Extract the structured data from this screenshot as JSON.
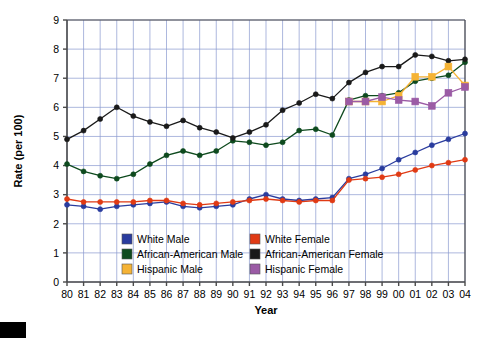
{
  "chart_data": {
    "type": "line",
    "title": "",
    "xlabel": "Year",
    "ylabel": "Rate (per 100)",
    "xlim": [
      80,
      104
    ],
    "ylim": [
      0,
      9
    ],
    "ytick_step": 1,
    "grid": true,
    "legend_position": "inside-bottom",
    "categories": [
      "80",
      "81",
      "82",
      "83",
      "84",
      "85",
      "86",
      "87",
      "88",
      "89",
      "90",
      "91",
      "92",
      "93",
      "94",
      "95",
      "96",
      "97",
      "98",
      "99",
      "00",
      "01",
      "02",
      "03",
      "04"
    ],
    "x": [
      1980,
      1981,
      1982,
      1983,
      1984,
      1985,
      1986,
      1987,
      1988,
      1989,
      1990,
      1991,
      1992,
      1993,
      1994,
      1995,
      1996,
      1997,
      1998,
      1999,
      2000,
      2001,
      2002,
      2003,
      2004
    ],
    "yticks": [
      "0",
      "1",
      "2",
      "3",
      "4",
      "5",
      "6",
      "7",
      "8",
      "9"
    ],
    "series": [
      {
        "name": "White Male",
        "color": "#2A3C9E",
        "marker": "circle",
        "values": [
          2.65,
          2.6,
          2.5,
          2.6,
          2.65,
          2.7,
          2.75,
          2.6,
          2.55,
          2.6,
          2.65,
          2.85,
          3.0,
          2.85,
          2.8,
          2.85,
          2.9,
          3.55,
          3.7,
          3.9,
          4.2,
          4.45,
          4.7,
          4.9,
          5.1
        ]
      },
      {
        "name": "White Female",
        "color": "#E03A14",
        "marker": "circle",
        "values": [
          2.85,
          2.75,
          2.75,
          2.75,
          2.75,
          2.8,
          2.8,
          2.7,
          2.65,
          2.7,
          2.75,
          2.8,
          2.85,
          2.8,
          2.75,
          2.8,
          2.8,
          3.5,
          3.55,
          3.6,
          3.7,
          3.85,
          4.0,
          4.1,
          4.2
        ]
      },
      {
        "name": "African-American Male",
        "color": "#0E4A1E",
        "marker": "circle",
        "values": [
          4.05,
          3.8,
          3.65,
          3.55,
          3.7,
          4.05,
          4.35,
          4.5,
          4.35,
          4.5,
          4.85,
          4.8,
          4.7,
          4.8,
          5.2,
          5.25,
          5.05,
          6.25,
          6.4,
          6.4,
          6.5,
          6.9,
          7.0,
          7.1,
          7.55
        ]
      },
      {
        "name": "African-American Female",
        "color": "#1A1A1A",
        "marker": "circle",
        "values": [
          4.9,
          5.2,
          5.6,
          6.0,
          5.7,
          5.5,
          5.35,
          5.55,
          5.3,
          5.15,
          4.95,
          5.15,
          5.4,
          5.9,
          6.15,
          6.45,
          6.3,
          6.85,
          7.2,
          7.4,
          7.4,
          7.8,
          7.75,
          7.6,
          7.65
        ]
      },
      {
        "name": "Hispanic Male",
        "color": "#F5B335",
        "marker": "square",
        "values": [
          null,
          null,
          null,
          null,
          null,
          null,
          null,
          null,
          null,
          null,
          null,
          null,
          null,
          null,
          null,
          null,
          null,
          6.2,
          6.2,
          6.2,
          6.4,
          7.05,
          7.05,
          7.4,
          6.75
        ]
      },
      {
        "name": "Hispanic Female",
        "color": "#9B5BA5",
        "marker": "square",
        "values": [
          null,
          null,
          null,
          null,
          null,
          null,
          null,
          null,
          null,
          null,
          null,
          null,
          null,
          null,
          null,
          null,
          null,
          6.2,
          6.2,
          6.35,
          6.25,
          6.2,
          6.05,
          6.5,
          6.7
        ]
      }
    ],
    "legend": [
      {
        "label": "White Male",
        "color": "#2A3C9E"
      },
      {
        "label": "White Female",
        "color": "#E03A14"
      },
      {
        "label": "African-American Male",
        "color": "#0E4A1E"
      },
      {
        "label": "African-American Female",
        "color": "#1A1A1A"
      },
      {
        "label": "Hispanic Male",
        "color": "#F5B335"
      },
      {
        "label": "Hispanic Female",
        "color": "#9B5BA5"
      }
    ]
  },
  "style": {
    "grid_color": "#8a9ad0",
    "axis_color": "#4a4a4a",
    "plot_bg": "#ffffff"
  }
}
